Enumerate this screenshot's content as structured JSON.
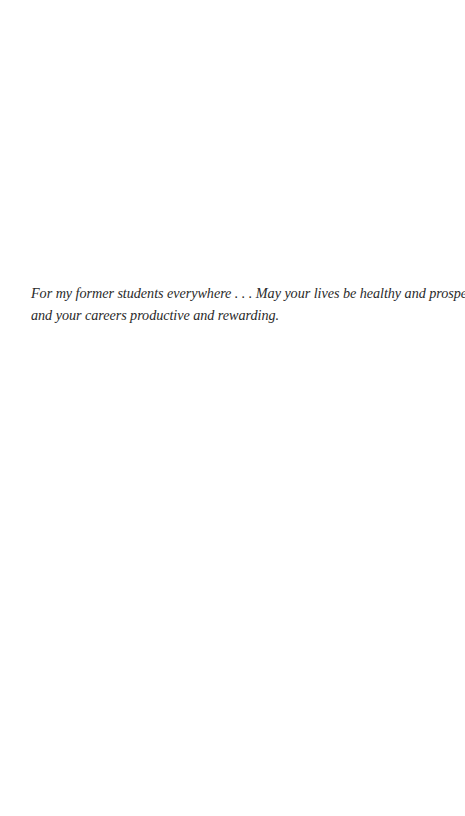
{
  "dedication": {
    "lines": [
      "For my former students everywhere . . . May your lives be healthy and prosperous",
      "and your careers productive and rewarding."
    ]
  }
}
